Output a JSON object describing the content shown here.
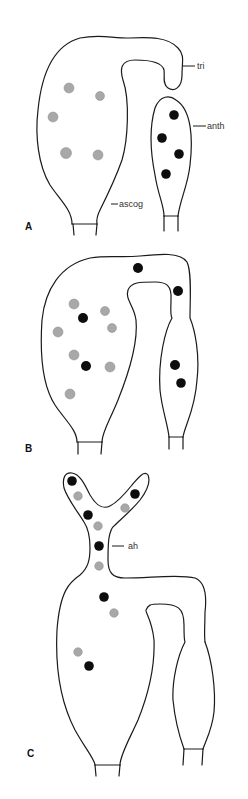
{
  "figure": {
    "panels": [
      {
        "id": "A",
        "label": "A",
        "labels": {
          "trichogyne": "tri",
          "antheridium": "anth",
          "ascogonium": "ascog"
        }
      },
      {
        "id": "B",
        "label": "B"
      },
      {
        "id": "C",
        "label": "C",
        "labels": {
          "ascogenous_hypha": "ah"
        }
      }
    ],
    "legend": {
      "nucleus_female": "stippled nucleus",
      "nucleus_male": "black nucleus"
    },
    "colors": {
      "outline": "#1a1a1a",
      "male_nucleus": "#0d0d0d",
      "female_nucleus": "#a8a8a8"
    }
  }
}
